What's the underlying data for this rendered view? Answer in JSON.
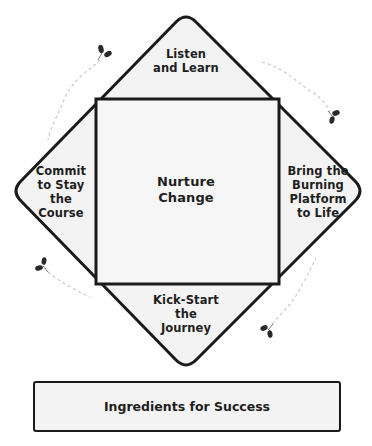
{
  "diagram": {
    "title": "Ingredients for Success",
    "center": {
      "label": "Nurture\nChange"
    },
    "sections": {
      "top": {
        "label": "Listen\nand Learn"
      },
      "right": {
        "label": "Bring the\nBurning\nPlatform\nto Life"
      },
      "bottom": {
        "label": "Kick-Start\nthe\nJourney"
      },
      "left": {
        "label": "Commit\nto Stay\nthe\nCourse"
      }
    },
    "footer_bar": {
      "label": "Ingredients for Success"
    },
    "decorations": {
      "icon": "sprout-icon",
      "count": 4,
      "trail_style": "dashed"
    },
    "colors": {
      "stroke": "#1a1a1a",
      "fill": "#f3f3f3",
      "text": "#1e1e1e",
      "trail": "#bdbdbd",
      "background": "#ffffff"
    }
  }
}
